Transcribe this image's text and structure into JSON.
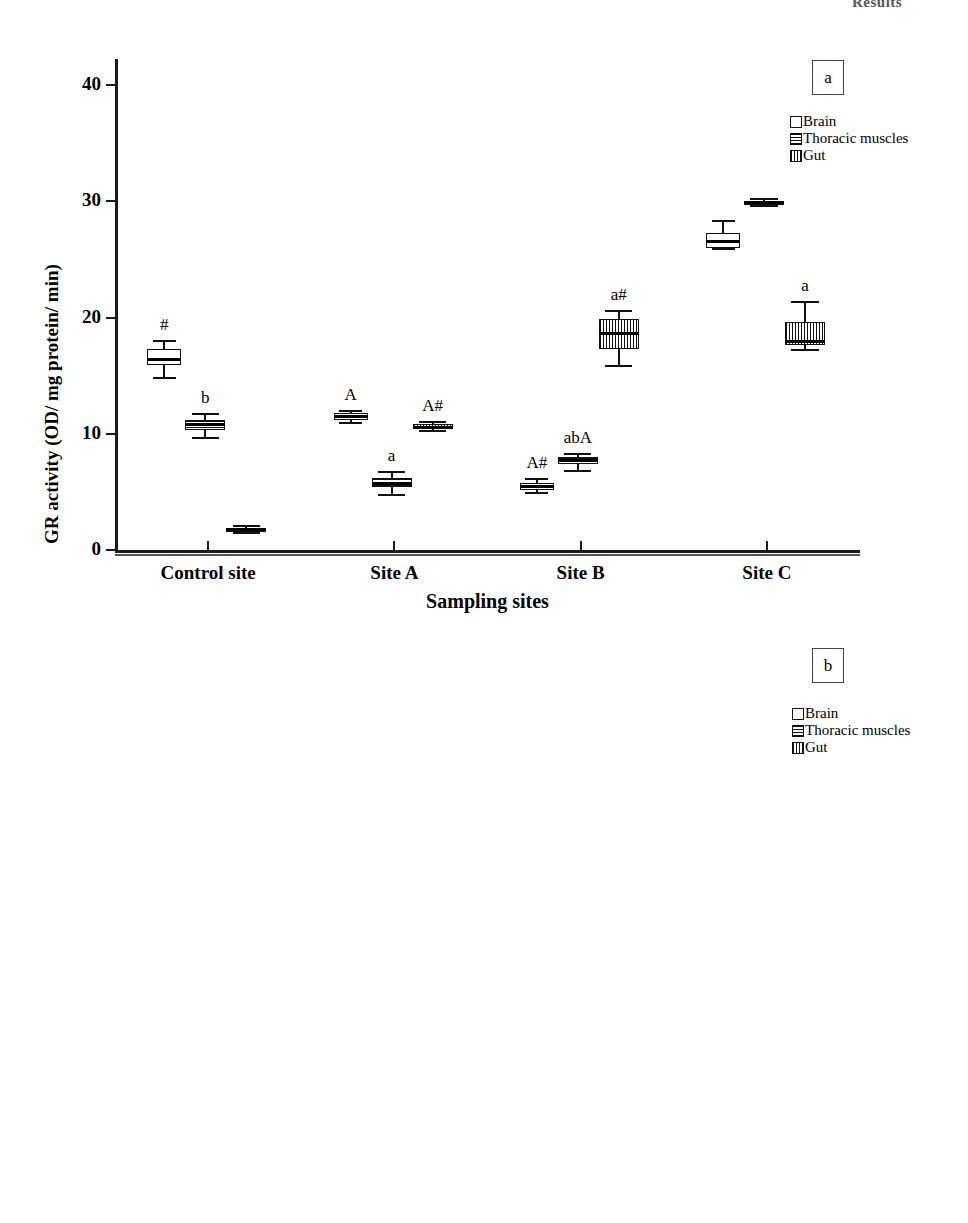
{
  "page_header": "Results",
  "chart_data": [
    {
      "id": "a",
      "type": "box",
      "panel_tag": "a",
      "title": "",
      "xlabel": "Sampling sites",
      "ylabel": "GR activity (OD/ mg protein/ min)",
      "ylim": [
        0,
        42
      ],
      "yticks": [
        0,
        10,
        20,
        30,
        40
      ],
      "ytick_labels": [
        "0",
        "10",
        "20",
        "30",
        "40"
      ],
      "categories": [
        "Control site",
        "Site A",
        "Site B",
        "Site C"
      ],
      "legend": [
        {
          "label": "Brain",
          "pattern": "brain"
        },
        {
          "label": "Thoracic muscles",
          "pattern": "thoracic"
        },
        {
          "label": "Gut",
          "pattern": "gut"
        }
      ],
      "legend_position": "top-right",
      "grid": false,
      "series": [
        {
          "name": "Brain",
          "pattern": "brain",
          "boxes": [
            {
              "category": "Control site",
              "min": 14.8,
              "q1": 15.9,
              "median": 16.4,
              "q3": 17.3,
              "max": 18.0,
              "sig": "#"
            },
            {
              "category": "Site A",
              "min": 10.9,
              "q1": 11.2,
              "median": 11.5,
              "q3": 11.8,
              "max": 12.0,
              "sig": "A"
            },
            {
              "category": "Site B",
              "min": 4.9,
              "q1": 5.2,
              "median": 5.5,
              "q3": 5.8,
              "max": 6.1,
              "sig": "A#"
            },
            {
              "category": "Site C",
              "min": 25.9,
              "q1": 26.0,
              "median": 26.6,
              "q3": 27.3,
              "max": 28.3,
              "sig": ""
            }
          ]
        },
        {
          "name": "Thoracic muscles",
          "pattern": "thoracic",
          "boxes": [
            {
              "category": "Control site",
              "min": 9.6,
              "q1": 10.3,
              "median": 10.8,
              "q3": 11.2,
              "max": 11.7,
              "sig": "b"
            },
            {
              "category": "Site A",
              "min": 4.7,
              "q1": 5.4,
              "median": 5.8,
              "q3": 6.2,
              "max": 6.7,
              "sig": "a"
            },
            {
              "category": "Site B",
              "min": 6.8,
              "q1": 7.4,
              "median": 7.7,
              "q3": 8.0,
              "max": 8.3,
              "sig": "abA"
            },
            {
              "category": "Site C",
              "min": 29.6,
              "q1": 29.8,
              "median": 29.9,
              "q3": 30.0,
              "max": 30.2,
              "sig": ""
            }
          ]
        },
        {
          "name": "Gut",
          "pattern": "gut",
          "boxes": [
            {
              "category": "Control site",
              "min": 1.5,
              "q1": 1.7,
              "median": 1.8,
              "q3": 1.9,
              "max": 2.1,
              "sig": ""
            },
            {
              "category": "Site A",
              "min": 10.2,
              "q1": 10.4,
              "median": 10.6,
              "q3": 10.8,
              "max": 11.0,
              "sig": "A#"
            },
            {
              "category": "Site B",
              "min": 15.8,
              "q1": 17.3,
              "median": 18.7,
              "q3": 19.9,
              "max": 20.6,
              "sig": "a#"
            },
            {
              "category": "Site C",
              "min": 17.2,
              "q1": 17.6,
              "median": 18.0,
              "q3": 19.6,
              "max": 21.3,
              "sig": "a"
            }
          ]
        }
      ]
    },
    {
      "id": "b",
      "type": "box",
      "panel_tag": "b",
      "title": "",
      "xlabel": "Sampling sites",
      "ylabel": "GR activity (OD/ mg protein/ min)",
      "ylim": [
        0,
        70
      ],
      "yticks": [
        0,
        20,
        40,
        60
      ],
      "ytick_labels": [
        "0",
        "20",
        "40",
        "60"
      ],
      "categories": [
        "Control site",
        "Site A",
        "Site B",
        "Site C"
      ],
      "legend": [
        {
          "label": "Brain",
          "pattern": "brain"
        },
        {
          "label": "Thoracic muscles",
          "pattern": "thoracic"
        },
        {
          "label": "Gut",
          "pattern": "gut"
        }
      ],
      "legend_position": "top-right",
      "grid": false,
      "series": [
        {
          "name": "Brain",
          "pattern": "brain",
          "boxes": [
            {
              "category": "Control site",
              "min": 5.5,
              "q1": 5.7,
              "median": 6.0,
              "q3": 6.2,
              "max": 6.4,
              "sig": "a"
            },
            {
              "category": "Site A",
              "min": 50.9,
              "q1": 51.6,
              "median": 52.1,
              "q3": 52.6,
              "max": 53.3,
              "sig": ""
            },
            {
              "category": "Site B",
              "min": 4.8,
              "q1": 4.9,
              "median": 5.0,
              "q3": 5.1,
              "max": 5.2,
              "sig": "a#"
            },
            {
              "category": "Site C",
              "min": 16.5,
              "q1": 18.0,
              "median": 18.9,
              "q3": 19.6,
              "max": 20.2,
              "sig": "b"
            }
          ]
        },
        {
          "name": "Thoracic muscles",
          "pattern": "thoracic",
          "boxes": [
            {
              "category": "Control site",
              "min": 17.6,
              "q1": 18.4,
              "median": 19.2,
              "q3": 20.0,
              "max": 21.0,
              "sig": "A"
            },
            {
              "category": "Site A",
              "min": 18.0,
              "q1": 18.2,
              "median": 18.4,
              "q3": 18.6,
              "max": 18.8,
              "sig": "b#"
            },
            {
              "category": "Site B",
              "min": 14.7,
              "q1": 14.9,
              "median": 15.2,
              "q3": 15.4,
              "max": 15.7,
              "sig": ""
            },
            {
              "category": "Site C",
              "min": 36.6,
              "q1": 37.2,
              "median": 37.6,
              "q3": 38.0,
              "max": 38.8,
              "sig": ""
            }
          ]
        },
        {
          "name": "Gut",
          "pattern": "gut",
          "boxes": [
            {
              "category": "Control site",
              "min": 19.0,
              "q1": 19.1,
              "median": 19.3,
              "q3": 19.4,
              "max": 19.6,
              "sig": "A"
            },
            {
              "category": "Site A",
              "min": 58.6,
              "q1": 59.0,
              "median": 59.3,
              "q3": 59.7,
              "max": 60.2,
              "sig": ""
            },
            {
              "category": "Site B",
              "min": 31.4,
              "q1": 31.8,
              "median": 32.1,
              "q3": 32.5,
              "max": 33.0,
              "sig": "a"
            },
            {
              "category": "Site C",
              "min": 33.3,
              "q1": 33.5,
              "median": 33.8,
              "q3": 34.0,
              "max": 34.3,
              "sig": "a"
            }
          ]
        }
      ]
    }
  ]
}
